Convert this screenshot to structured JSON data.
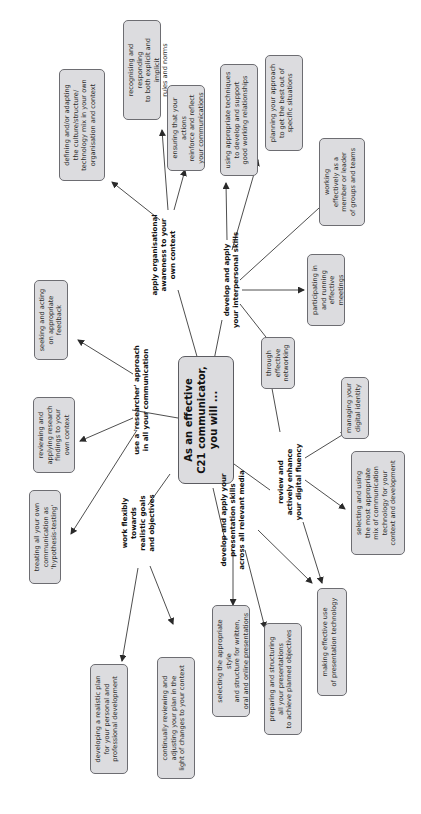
{
  "center": {
    "label": "As an effective\nC21 communicator,\nyou will ..."
  },
  "branches": {
    "org": {
      "label": "apply organisational\nawareness to your\nown context",
      "leaves": [
        "defining and/or adapting\nthe culture/structure/\ntechnology mix in your own\norganisation and context",
        "recognising and responding\nto both explicit and implicit\nrules and norms",
        "ensuring that your actions\nreinforce and reflect\nyour communications"
      ]
    },
    "interpersonal": {
      "label": "develop and apply\nyour interpersonal skills",
      "leaves": [
        "using appropriate techniques\nto develop and support\ngood working relationships",
        "planning your approach\nto get the best out of\nspecific situations",
        "working\neffectively as a\nmember or leader\nof groups and teams",
        "participating in\nand running\neffective meetings",
        "through\neffective\nnetworking"
      ]
    },
    "digital": {
      "label": "review and\nactively enhance\nyour digital fluency",
      "leaves": [
        "managing your\ndigital identity",
        "selecting and using\nthe most appropriate\nmix of communication\ntechnology for your\ncontext and development",
        "making effective use\nof presentation technology"
      ]
    },
    "presentation": {
      "label": "develop and apply your\npresentation skills\nacross all relevant media",
      "leaves": [
        "selecting the appropriate style\nand structure for written,\noral and online presentations",
        "preparing and structuring\nall your presentations\nto achieve planned objectives"
      ]
    },
    "goals": {
      "label": "work flexibly\ntowards\nrealistic goals\nand objectives",
      "leaves": [
        "developing a realistic plan\nfor your personal and\nprofessional development",
        "continually reviewing and\nadjusting your plan in the\nlight of changes to your context"
      ]
    },
    "researcher": {
      "label": "use a 'researcher' approach\nin all your communication",
      "leaves": [
        "seeking and acting\non appropriate\nfeedback",
        "reviewing and\napplying research\nfindings to your\nown context",
        "treating all your own\ncommunication as\n'hypothesis-testing'"
      ]
    }
  },
  "colors": {
    "node_fill": "#dcdcdf",
    "node_border": "#6d6d72",
    "line": "#3a3a3a",
    "background": "#ffffff"
  }
}
